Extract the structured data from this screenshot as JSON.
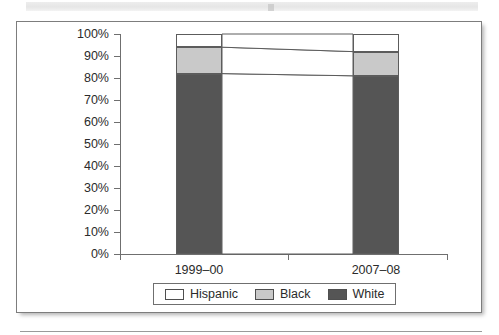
{
  "chart_data": {
    "type": "bar",
    "subtype": "stacked-100-percent",
    "title": "",
    "xlabel": "",
    "ylabel": "",
    "categories": [
      "1999–00",
      "2007–08"
    ],
    "series": [
      {
        "name": "White",
        "color": "#555555",
        "values": [
          82,
          81
        ]
      },
      {
        "name": "Black",
        "color": "#c9c9c9",
        "values": [
          12,
          11
        ]
      },
      {
        "name": "Hispanic",
        "color": "#ffffff",
        "values": [
          6,
          8
        ]
      }
    ],
    "stack_order_bottom_to_top": [
      "White",
      "Black",
      "Hispanic"
    ],
    "ylim": [
      0,
      100
    ],
    "ytick_values": [
      0,
      10,
      20,
      30,
      40,
      50,
      60,
      70,
      80,
      90,
      100
    ],
    "ytick_labels": [
      "0%",
      "10%",
      "20%",
      "30%",
      "40%",
      "50%",
      "60%",
      "70%",
      "80%",
      "90%",
      "100%"
    ],
    "grid": false,
    "legend_position": "bottom",
    "connector_bands": true
  },
  "axis": {
    "y_labels": [
      "100%",
      "90%",
      "80%",
      "70%",
      "60%",
      "50%",
      "40%",
      "30%",
      "20%",
      "10%",
      "0%"
    ],
    "x_labels": [
      "1999–00",
      "2007–08"
    ]
  },
  "legend": {
    "items": [
      {
        "label": "Hispanic",
        "color": "#ffffff"
      },
      {
        "label": "Black",
        "color": "#c9c9c9"
      },
      {
        "label": "White",
        "color": "#555555"
      }
    ]
  },
  "colors": {
    "hispanic": "#ffffff",
    "black": "#c9c9c9",
    "white": "#555555",
    "axis": "#6f6f6f",
    "frame": "#7d7d7d",
    "text": "#2b2b2b"
  }
}
